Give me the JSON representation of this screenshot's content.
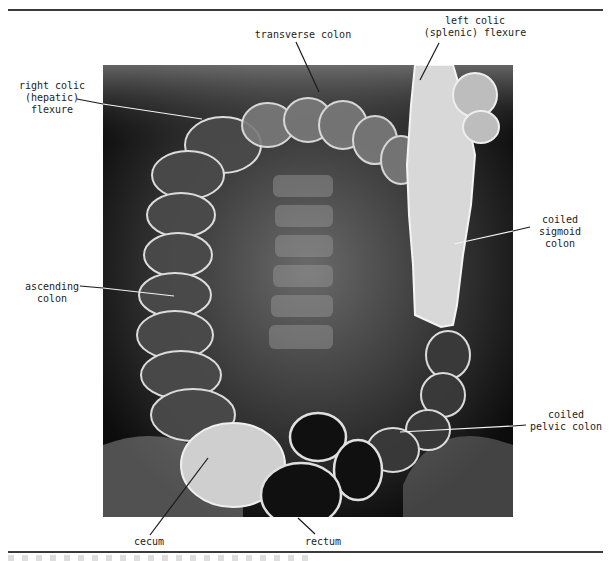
{
  "figure": {
    "type": "barium enema radiograph of large intestine",
    "colors": {
      "rule": "#3a3a3a",
      "label_text": "#222222",
      "leader_dark": "#1a1a1a",
      "leader_light": "#f2f2f2",
      "xray_background": "#0c0c0c"
    },
    "labels": {
      "transverse_colon": "transverse colon",
      "left_colic_flexure": "left colic\n(splenic) flexure",
      "right_colic_flexure": "right colic\n(hepatic)\nflexure",
      "ascending_colon": "ascending\ncolon",
      "coiled_sigmoid_colon": "coiled\nsigmoid\ncolon",
      "coiled_pelvic_colon": "coiled\npelvic colon",
      "cecum": "cecum",
      "rectum": "rectum"
    }
  }
}
